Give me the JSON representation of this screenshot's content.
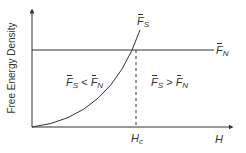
{
  "diagram": {
    "y_axis_label": "Free Energy Density",
    "x_axis_label": "H",
    "critical_field_label": "H",
    "critical_field_sub": "c",
    "curves": {
      "superconducting": {
        "symbol": "F",
        "sub": "S"
      },
      "normal": {
        "symbol": "F",
        "sub": "N"
      }
    },
    "regions": {
      "left": {
        "a": "F",
        "a_sub": "S",
        "op": " < ",
        "b": "F",
        "b_sub": "N"
      },
      "right": {
        "a": "F",
        "a_sub": "S",
        "op": " > ",
        "b": "F",
        "b_sub": "N"
      }
    },
    "colors": {
      "line": "#333333",
      "background": "#ffffff"
    }
  }
}
